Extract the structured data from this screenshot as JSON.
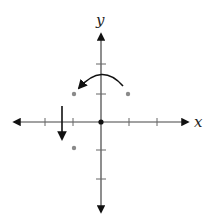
{
  "diagram": {
    "type": "coordinate-plane",
    "x_label": "x",
    "y_label": "y",
    "origin_px": [
      101,
      122
    ],
    "unit_px": 28,
    "x_ticks": [
      -3,
      -2,
      -1,
      1,
      2,
      3
    ],
    "y_ticks": [
      -2,
      -1,
      1,
      2
    ],
    "points": [
      {
        "x": -1,
        "y": 1,
        "color": "#8a8a8a"
      },
      {
        "x": 1,
        "y": 1,
        "color": "#8a8a8a"
      },
      {
        "x": -1,
        "y": -1,
        "color": "#8a8a8a"
      }
    ],
    "origin_point": {
      "x": 0,
      "y": 0,
      "color": "#111111"
    },
    "arrows": [
      {
        "kind": "curved",
        "description": "counterclockwise rotation arc from (1,1) over y-axis to (-1,1)"
      },
      {
        "kind": "straight",
        "description": "downward translation arrow at x=-1.4 from y=0.55 to y=-0.7"
      }
    ],
    "colors": {
      "axis": "#444444",
      "arrow": "#111111",
      "point": "#8a8a8a"
    }
  }
}
